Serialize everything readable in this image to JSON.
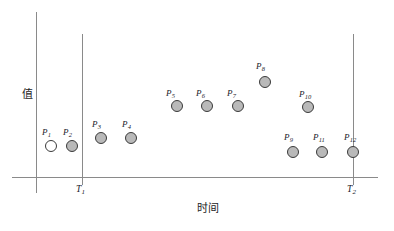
{
  "figure": {
    "width": 394,
    "height": 231,
    "background": "#ffffff",
    "line_color": "#8a8a8a",
    "marker_fill": "#b9b9b9",
    "marker_open_fill": "#ffffff",
    "marker_stroke": "#3a3a3a",
    "text_color": "#20202a"
  },
  "axes": {
    "y_axis_label": "值",
    "x_axis_label": "时间",
    "y_axis_x": 36,
    "y_axis_top": 12,
    "y_axis_bottom": 193,
    "x_axis_y": 177,
    "x_axis_left": 12,
    "x_axis_right": 378
  },
  "boundaries": [
    {
      "id": "T1",
      "label": "T",
      "sub": "1",
      "x": 82,
      "top": 34,
      "bottom": 185,
      "label_x": 76,
      "label_y": 185
    },
    {
      "id": "T2",
      "label": "T",
      "sub": "2",
      "x": 353,
      "top": 34,
      "bottom": 185,
      "label_x": 347,
      "label_y": 185
    }
  ],
  "chart_data": {
    "type": "scatter",
    "title": "",
    "xlabel": "时间",
    "ylabel": "值",
    "grid": false,
    "legend": null,
    "annotations": [
      "T1",
      "T2"
    ],
    "series": [
      {
        "name": "points",
        "points": [
          {
            "label": "P",
            "sub": "1",
            "cx": 51,
            "cy": 146,
            "filled": false,
            "label_x": 42,
            "label_y": 128
          },
          {
            "label": "P",
            "sub": "2",
            "cx": 72,
            "cy": 146,
            "filled": true,
            "label_x": 63,
            "label_y": 128
          },
          {
            "label": "P",
            "sub": "3",
            "cx": 101,
            "cy": 138,
            "filled": true,
            "label_x": 92,
            "label_y": 120
          },
          {
            "label": "P",
            "sub": "4",
            "cx": 131,
            "cy": 138,
            "filled": true,
            "label_x": 122,
            "label_y": 120
          },
          {
            "label": "P",
            "sub": "5",
            "cx": 177,
            "cy": 106,
            "filled": true,
            "label_x": 166,
            "label_y": 89
          },
          {
            "label": "P",
            "sub": "6",
            "cx": 207,
            "cy": 106,
            "filled": true,
            "label_x": 196,
            "label_y": 89
          },
          {
            "label": "P",
            "sub": "7",
            "cx": 238,
            "cy": 106,
            "filled": true,
            "label_x": 227,
            "label_y": 89
          },
          {
            "label": "P",
            "sub": "8",
            "cx": 265,
            "cy": 82,
            "filled": true,
            "label_x": 256,
            "label_y": 62
          },
          {
            "label": "P",
            "sub": "9",
            "cx": 293,
            "cy": 152,
            "filled": true,
            "label_x": 284,
            "label_y": 133
          },
          {
            "label": "P",
            "sub": "10",
            "cx": 308,
            "cy": 107,
            "filled": true,
            "label_x": 299,
            "label_y": 90
          },
          {
            "label": "P",
            "sub": "11",
            "cx": 322,
            "cy": 152,
            "filled": true,
            "label_x": 313,
            "label_y": 133
          },
          {
            "label": "P",
            "sub": "12",
            "cx": 353,
            "cy": 152,
            "filled": true,
            "label_x": 344,
            "label_y": 133
          }
        ]
      }
    ]
  },
  "axis_title_positions": {
    "x_title_left": 197,
    "x_title_top": 203,
    "y_title_left": 21,
    "y_title_top": 88
  }
}
